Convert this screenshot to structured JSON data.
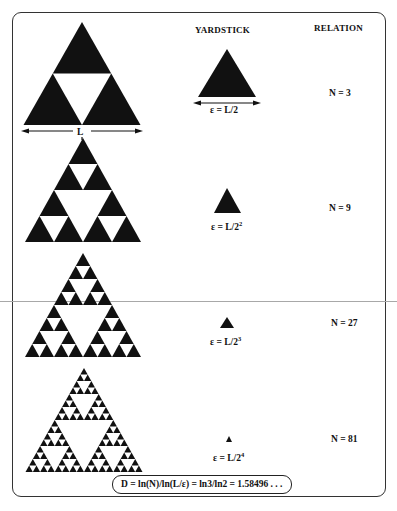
{
  "headers": {
    "yardstick": "YARDSTICK",
    "relation": "RELATION"
  },
  "length_label": "L",
  "rows": [
    {
      "level": 1,
      "yardstick_base": "ε = L/2",
      "yardstick_exp": "",
      "relation": "N = 3"
    },
    {
      "level": 2,
      "yardstick_base": "ε = L/2",
      "yardstick_exp": "2",
      "relation": "N = 9"
    },
    {
      "level": 3,
      "yardstick_base": "ε = L/2",
      "yardstick_exp": "3",
      "relation": "N = 27"
    },
    {
      "level": 4,
      "yardstick_base": "ε = L/2",
      "yardstick_exp": "4",
      "relation": "N = 81"
    }
  ],
  "formula": "D = ln(N)/ln(L/ε) = ln3/ln2 = 1.58496 . . .",
  "colors": {
    "ink": "#111111",
    "frame": "#333333",
    "scan_line": "#a8a8a8",
    "background": "#ffffff"
  }
}
